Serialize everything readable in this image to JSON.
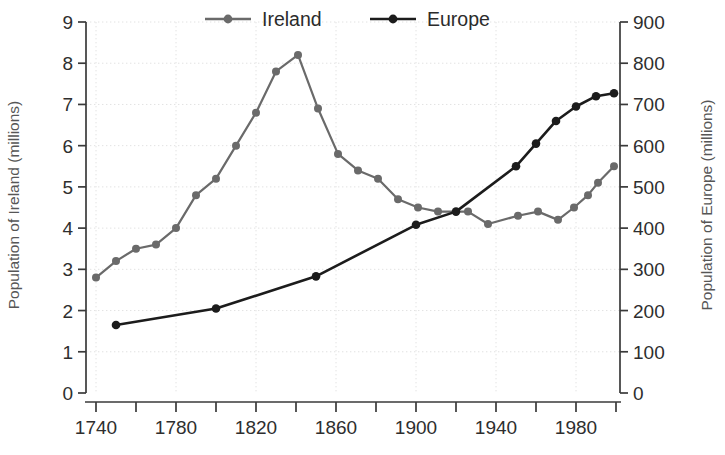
{
  "chart_data": {
    "type": "line",
    "title": "",
    "xlabel": "",
    "ylabel": "Population of Ireland (millions)",
    "ylabel_right": "Population of Europe (millions)",
    "xlim": [
      1735,
      2002
    ],
    "ylim": [
      0,
      9
    ],
    "ylim_right": [
      0,
      900
    ],
    "grid": true,
    "legend_position": "top",
    "x_tick_labels": [
      "1740",
      "1780",
      "1820",
      "1860",
      "1900",
      "1940",
      "1980"
    ],
    "x_tick_values": [
      1740,
      1780,
      1820,
      1860,
      1900,
      1940,
      1980
    ],
    "x_minor_tick_values": [
      1740,
      1760,
      1780,
      1800,
      1820,
      1840,
      1860,
      1880,
      1900,
      1920,
      1940,
      1960,
      1980,
      2000
    ],
    "y_tick_labels": [
      "0",
      "1",
      "2",
      "3",
      "4",
      "5",
      "6",
      "7",
      "8",
      "9"
    ],
    "y_tick_values": [
      0,
      1,
      2,
      3,
      4,
      5,
      6,
      7,
      8,
      9
    ],
    "y_right_tick_labels": [
      "0",
      "100",
      "200",
      "300",
      "400",
      "500",
      "600",
      "700",
      "800",
      "900"
    ],
    "y_right_tick_values": [
      0,
      100,
      200,
      300,
      400,
      500,
      600,
      700,
      800,
      900
    ],
    "series": [
      {
        "name": "Ireland",
        "axis": "left",
        "color": "#6a6a6a",
        "marker": "circle",
        "units": "millions",
        "points": [
          {
            "x": 1740,
            "y": 2.8
          },
          {
            "x": 1750,
            "y": 3.2
          },
          {
            "x": 1760,
            "y": 3.5
          },
          {
            "x": 1770,
            "y": 3.6
          },
          {
            "x": 1780,
            "y": 4.0
          },
          {
            "x": 1790,
            "y": 4.8
          },
          {
            "x": 1800,
            "y": 5.2
          },
          {
            "x": 1810,
            "y": 6.0
          },
          {
            "x": 1820,
            "y": 6.8
          },
          {
            "x": 1830,
            "y": 7.8
          },
          {
            "x": 1841,
            "y": 8.2
          },
          {
            "x": 1851,
            "y": 6.9
          },
          {
            "x": 1861,
            "y": 5.8
          },
          {
            "x": 1871,
            "y": 5.4
          },
          {
            "x": 1881,
            "y": 5.2
          },
          {
            "x": 1891,
            "y": 4.7
          },
          {
            "x": 1901,
            "y": 4.5
          },
          {
            "x": 1911,
            "y": 4.4
          },
          {
            "x": 1926,
            "y": 4.4
          },
          {
            "x": 1936,
            "y": 4.1
          },
          {
            "x": 1951,
            "y": 4.3
          },
          {
            "x": 1961,
            "y": 4.4
          },
          {
            "x": 1971,
            "y": 4.2
          },
          {
            "x": 1979,
            "y": 4.5
          },
          {
            "x": 1986,
            "y": 4.8
          },
          {
            "x": 1991,
            "y": 5.1
          },
          {
            "x": 1999,
            "y": 5.5
          }
        ]
      },
      {
        "name": "Europe",
        "axis": "right",
        "color": "#1c1c1c",
        "marker": "circle",
        "units": "millions",
        "points": [
          {
            "x": 1750,
            "y": 165
          },
          {
            "x": 1800,
            "y": 205
          },
          {
            "x": 1850,
            "y": 283
          },
          {
            "x": 1900,
            "y": 408
          },
          {
            "x": 1920,
            "y": 440
          },
          {
            "x": 1950,
            "y": 550
          },
          {
            "x": 1960,
            "y": 605
          },
          {
            "x": 1970,
            "y": 660
          },
          {
            "x": 1980,
            "y": 695
          },
          {
            "x": 1990,
            "y": 720
          },
          {
            "x": 1999,
            "y": 727
          }
        ]
      }
    ]
  },
  "legend": {
    "items": [
      {
        "label": "Ireland",
        "color": "#6a6a6a"
      },
      {
        "label": "Europe",
        "color": "#1c1c1c"
      }
    ]
  }
}
